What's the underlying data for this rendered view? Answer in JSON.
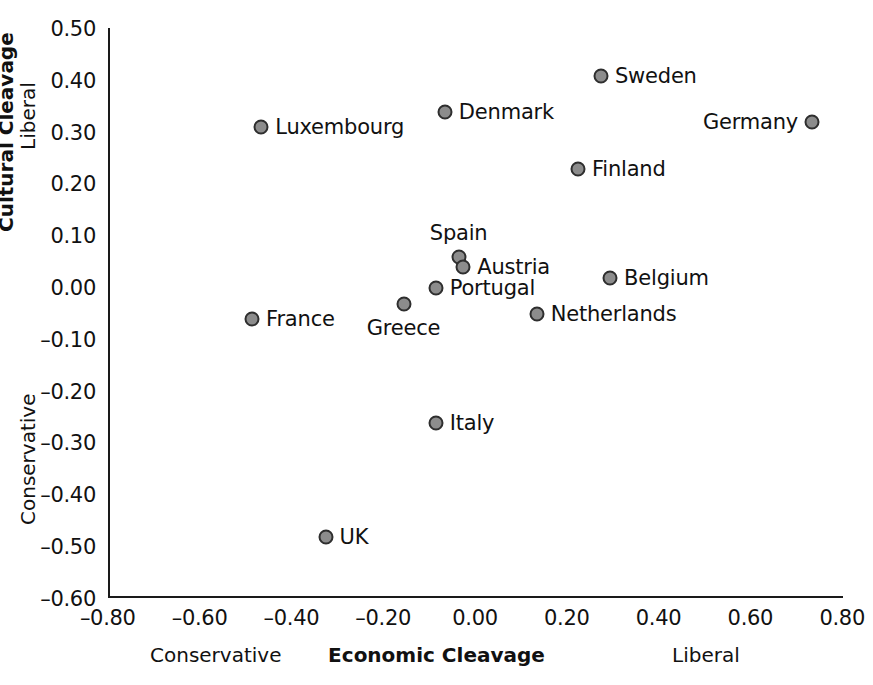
{
  "chart_data": {
    "type": "scatter",
    "title": "",
    "xlabel": "Economic Cleavage",
    "ylabel": "Cultural Cleavage",
    "xlim": [
      -0.9,
      0.88
    ],
    "ylim": [
      -0.6,
      0.5
    ],
    "grid": false,
    "legend": "none",
    "xticks": [
      "–0.80",
      "–0.60",
      "–0.40",
      "–0.20",
      "0.00",
      "0.20",
      "0.40",
      "0.60",
      "0.80"
    ],
    "xtick_values": [
      -0.8,
      -0.6,
      -0.4,
      -0.2,
      0.0,
      0.2,
      0.4,
      0.6,
      0.8
    ],
    "yticks": [
      "0.50",
      "0.40",
      "0.30",
      "0.20",
      "0.10",
      "0.00",
      "–0.10",
      "–0.20",
      "–0.30",
      "–0.40",
      "–0.50",
      "–0.60"
    ],
    "ytick_values": [
      0.5,
      0.4,
      0.3,
      0.2,
      0.1,
      0.0,
      -0.1,
      -0.2,
      -0.3,
      -0.4,
      -0.5,
      -0.6
    ],
    "x_axis_low_label": "Conservative",
    "x_axis_high_label": "Liberal",
    "y_axis_low_label": "Conservative",
    "y_axis_high_label": "Liberal",
    "marker_fill": "#8c8c8c",
    "marker_edge": "#2e2e2e",
    "points": [
      {
        "name": "Sweden",
        "x": 0.27,
        "y": 0.41,
        "label_pos": "right"
      },
      {
        "name": "Denmark",
        "x": -0.07,
        "y": 0.34,
        "label_pos": "right"
      },
      {
        "name": "Luxembourg",
        "x": -0.47,
        "y": 0.31,
        "label_pos": "right"
      },
      {
        "name": "Germany",
        "x": 0.73,
        "y": 0.32,
        "label_pos": "left"
      },
      {
        "name": "Finland",
        "x": 0.22,
        "y": 0.23,
        "label_pos": "right"
      },
      {
        "name": "Spain",
        "x": -0.04,
        "y": 0.06,
        "label_pos": "above"
      },
      {
        "name": "Austria",
        "x": -0.03,
        "y": 0.04,
        "label_pos": "right"
      },
      {
        "name": "Belgium",
        "x": 0.29,
        "y": 0.02,
        "label_pos": "right"
      },
      {
        "name": "Portugal",
        "x": -0.09,
        "y": 0.0,
        "label_pos": "right"
      },
      {
        "name": "Greece",
        "x": -0.16,
        "y": -0.03,
        "label_pos": "below"
      },
      {
        "name": "Netherlands",
        "x": 0.13,
        "y": -0.05,
        "label_pos": "right"
      },
      {
        "name": "France",
        "x": -0.49,
        "y": -0.06,
        "label_pos": "right"
      },
      {
        "name": "Italy",
        "x": -0.09,
        "y": -0.26,
        "label_pos": "right"
      },
      {
        "name": "UK",
        "x": -0.33,
        "y": -0.48,
        "label_pos": "right"
      }
    ]
  }
}
